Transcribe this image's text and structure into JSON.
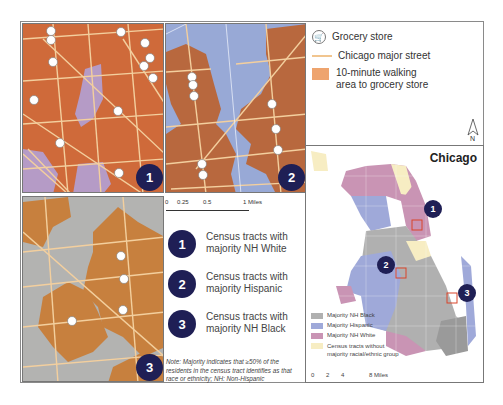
{
  "legend_top": {
    "items": [
      {
        "icon": "grocery-cart-icon",
        "label": "Grocery store"
      },
      {
        "icon": "street-line",
        "label": "Chicago major street",
        "color": "#f1c58f"
      },
      {
        "icon": "walk-area-swatch",
        "label": "10-minute walking area to grocery store",
        "label_line1": "10-minute walking",
        "label_line2": "area to grocery store",
        "color": "#eea46e"
      }
    ]
  },
  "panels": [
    {
      "number": "1",
      "description": "Census tracts with majority NH White",
      "line1": "Census tracts with",
      "line2": "majority NH White"
    },
    {
      "number": "2",
      "description": "Census tracts with majority Hispanic",
      "line1": "Census tracts with",
      "line2": "majority Hispanic"
    },
    {
      "number": "3",
      "description": "Census tracts with majority NH Black",
      "line1": "Census tracts with",
      "line2": "majority NH Black"
    }
  ],
  "scale_small": {
    "ticks": [
      "0",
      "0.25",
      "0.5",
      "1 Miles"
    ]
  },
  "note": "Note: Majority indicates that ≥50% of the residents in the census tract identifies as that race or ethnicity; NH: Non-Hispanic",
  "north_label": "N",
  "chicago_map": {
    "title": "Chicago",
    "legend": [
      {
        "label": "Majority NH Black",
        "color": "#b0b0b0"
      },
      {
        "label": "Majority Hispanic",
        "color": "#9fa9d9"
      },
      {
        "label": "Majority NH White",
        "color": "#c994b4"
      },
      {
        "label": "Census tracts without majority racial/ethnic group",
        "line1": "Census tracts without",
        "line2": "majority racial/ethnic group",
        "color": "#f7edc3"
      }
    ],
    "scale": {
      "ticks": [
        "0",
        "2",
        "4",
        "8 Miles"
      ]
    },
    "markers": [
      "1",
      "2",
      "3"
    ]
  },
  "colors": {
    "badge": "#1f1f55",
    "walk_area": "#cf6a3a",
    "hispanic_bg": "#98a9d6",
    "black_bg": "#b3b3b1",
    "street": "#f1c58f",
    "highlight_box": "#d9442a"
  }
}
